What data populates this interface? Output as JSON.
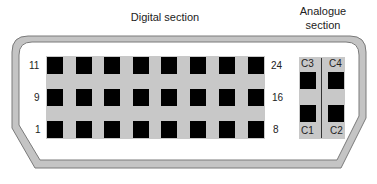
{
  "diagram": {
    "title_digital": "Digital section",
    "title_analogue_line1": "Analogue",
    "title_analogue_line2": "section",
    "digital": {
      "rows": 3,
      "columns": 8,
      "row_labels_left": [
        "11",
        "9",
        "1"
      ],
      "row_labels_right": [
        "24",
        "16",
        "8"
      ]
    },
    "analogue": {
      "pins": [
        "C3",
        "C4",
        "C1",
        "C2"
      ],
      "labels": {
        "c3": "C3",
        "c4": "C4",
        "c1": "C1",
        "c2": "C2"
      }
    },
    "colors": {
      "outline_fill": "#c4c4c4",
      "outline_stroke": "#7a7a7a",
      "band": "#c8c8c8",
      "pin": "#000000"
    }
  }
}
